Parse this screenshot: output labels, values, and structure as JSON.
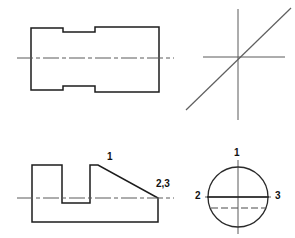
{
  "sheet": {
    "width": 295,
    "height": 238,
    "background": "#ffffff",
    "line_color": "#1c1c1c",
    "centerline_color": "#5a5a5a",
    "hidden_line_color": "#4a4a4a"
  },
  "views": {
    "top_left": {
      "name": "stepped-cylinder-front-view",
      "outline_points": "31,28 63,28 63,32 95,32 95,27 159,27 159,92 95,92 95,86 63,86 63,90 31,90 31,28",
      "centerline": {
        "x1": 17,
        "y1": 58,
        "x2": 174,
        "y2": 58
      }
    },
    "top_right": {
      "name": "axis-cross-with-diagonal",
      "horizontal": {
        "x1": 203,
        "y1": 57,
        "x2": 285,
        "y2": 57
      },
      "vertical": {
        "x1": 238,
        "y1": 9,
        "x2": 238,
        "y2": 120
      },
      "diagonal": {
        "x1": 186,
        "y1": 110,
        "x2": 291,
        "y2": 8
      }
    },
    "bottom_left": {
      "name": "notched-block-front-view",
      "outline_points": "32,165 62,165 62,203 90,203 90,165 98,165 158,198 158,222 32,222 32,165",
      "centerline": {
        "x1": 17,
        "y1": 198,
        "x2": 174,
        "y2": 198
      },
      "labels": [
        {
          "text": "1",
          "x": 107,
          "y": 152
        },
        {
          "text": "2,3",
          "x": 156,
          "y": 179
        }
      ]
    },
    "bottom_right": {
      "name": "circular-end-view",
      "circle": {
        "cx": 238,
        "cy": 197,
        "r": 30
      },
      "solid_chord": {
        "x1": 208,
        "y1": 197,
        "x2": 268,
        "y2": 197
      },
      "hidden_chord": {
        "x1": 211,
        "y1": 208,
        "x2": 266,
        "y2": 208
      },
      "vertical_centerline": {
        "x1": 238,
        "y1": 160,
        "x2": 238,
        "y2": 234
      },
      "horizontal_centerline": {
        "x1": 205,
        "y1": 197,
        "x2": 271,
        "y2": 197
      },
      "labels": [
        {
          "text": "1",
          "x": 234,
          "y": 148
        },
        {
          "text": "2",
          "x": 195,
          "y": 191
        },
        {
          "text": "3",
          "x": 275,
          "y": 191
        }
      ]
    }
  }
}
